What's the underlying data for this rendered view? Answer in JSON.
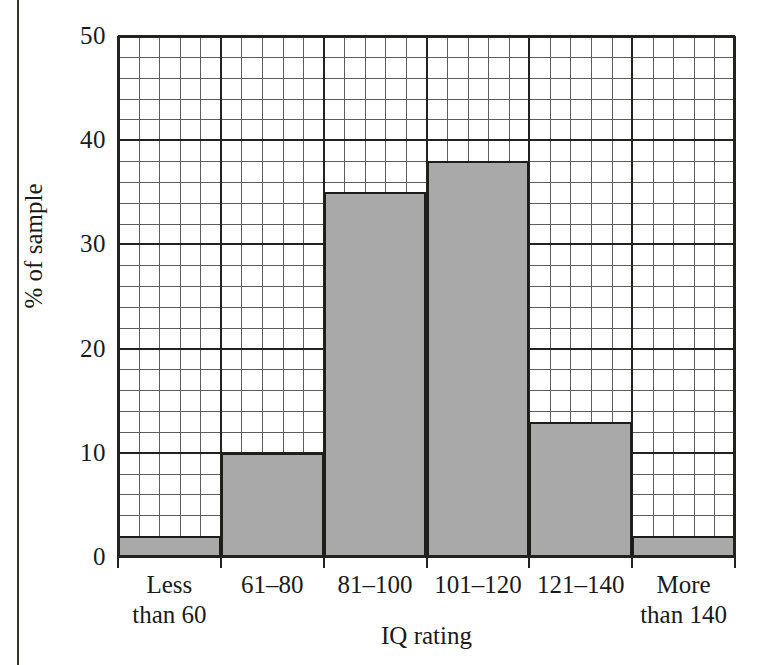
{
  "chart_data": {
    "type": "bar",
    "title": "",
    "xlabel": "IQ rating",
    "ylabel": "% of sample",
    "categories": [
      "Less than 60",
      "61–80",
      "81–100",
      "101–120",
      "121–140",
      "More than 140"
    ],
    "category_lines": [
      [
        "Less",
        "than 60"
      ],
      [
        "61–80",
        ""
      ],
      [
        "81–100",
        ""
      ],
      [
        "101–120",
        ""
      ],
      [
        "121–140",
        ""
      ],
      [
        "More",
        "than 140"
      ]
    ],
    "values": [
      2,
      10,
      35,
      38,
      13,
      2
    ],
    "ylim": [
      0,
      50
    ],
    "yticks": [
      0,
      10,
      20,
      30,
      40,
      50
    ],
    "ytick_labels": [
      "0",
      "10",
      "20",
      "30",
      "40",
      "50"
    ],
    "y_minor_step": 2,
    "x_minor_per_category": 5,
    "grid": "major and minor",
    "legend": "none",
    "bar_fill_color": "#a9a9a9",
    "bar_edge_color": "#1d1d1b",
    "grid_minor_color": "#5d5d5a",
    "grid_major_color": "#222220"
  }
}
